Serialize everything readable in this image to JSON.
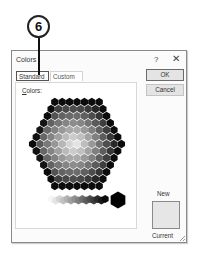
{
  "callout": {
    "number": "6"
  },
  "dialog": {
    "title": "Colors",
    "help_icon": "?",
    "close_icon": "✕",
    "tabs": [
      {
        "label": "Standard",
        "active": true
      },
      {
        "label": "Custom",
        "active": false
      }
    ],
    "colors_label_accel": "C",
    "colors_label_rest": "olors:",
    "ok_label": "OK",
    "cancel_label": "Cancel",
    "new_label": "New",
    "current_label": "Current",
    "new_color": "#e6e6e6",
    "palette": {
      "hex_rows": [
        7,
        8,
        9,
        10,
        11,
        12,
        13,
        12,
        11,
        10,
        9,
        8,
        7
      ],
      "grayscale_steps": 15,
      "selected_large_swatch_color": "#000000"
    }
  }
}
